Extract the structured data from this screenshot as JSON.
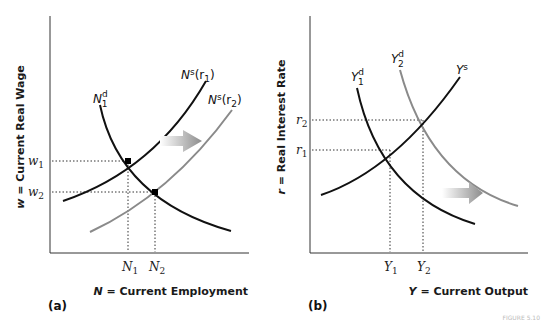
{
  "panel_a": {
    "label": "(a)",
    "y_axis_label": "w = Current Real Wage",
    "x_axis_label": "N = Current Employment",
    "y_ticks": [
      {
        "base": "w",
        "sub": "1"
      },
      {
        "base": "w",
        "sub": "2"
      }
    ],
    "x_ticks": [
      {
        "base": "N",
        "sub": "1"
      },
      {
        "base": "N",
        "sub": "2"
      }
    ],
    "curves": {
      "demand": {
        "base": "N",
        "sup": "d",
        "sub": "1"
      },
      "supply1": {
        "text": "N",
        "sup": "s",
        "arg": "(r",
        "argsub": "1",
        "close": ")"
      },
      "supply2": {
        "text": "N",
        "sup": "s",
        "arg": "(r",
        "argsub": "2",
        "close": ")"
      }
    },
    "shift_arrow": "right",
    "colors": {
      "original": "#111111",
      "shifted": "#8a8a8a"
    }
  },
  "panel_b": {
    "label": "(b)",
    "y_axis_label": "r = Real Interest Rate",
    "x_axis_label": "Y = Current Output",
    "y_ticks": [
      {
        "base": "r",
        "sub": "2"
      },
      {
        "base": "r",
        "sub": "1"
      }
    ],
    "x_ticks": [
      {
        "base": "Y",
        "sub": "1"
      },
      {
        "base": "Y",
        "sub": "2"
      }
    ],
    "curves": {
      "demand1": {
        "base": "Y",
        "sup": "d",
        "sub": "1"
      },
      "demand2": {
        "base": "Y",
        "sup": "d",
        "sub": "2"
      },
      "supply": {
        "base": "Y",
        "sup": "s"
      }
    },
    "shift_arrow": "right",
    "colors": {
      "original": "#111111",
      "shifted": "#8a8a8a"
    }
  },
  "footer": "FIGURE 5.10"
}
